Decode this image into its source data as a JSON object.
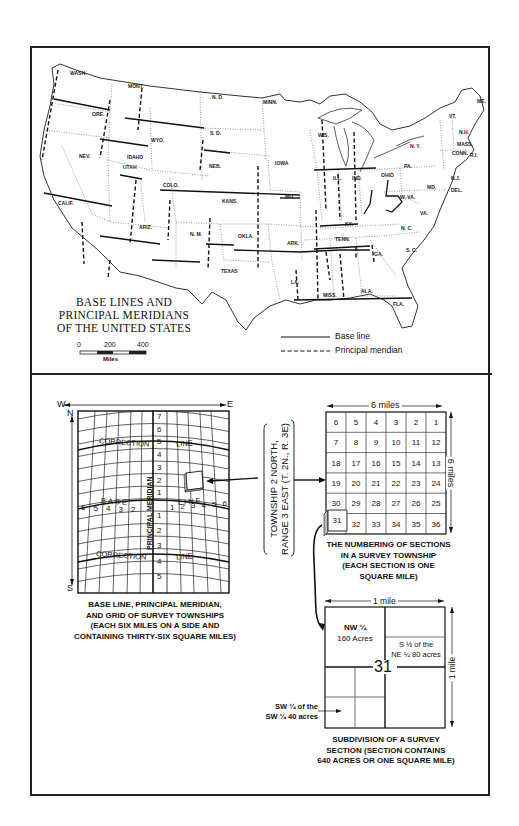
{
  "map": {
    "title_lines": [
      "BASE LINES AND",
      "PRINCIPAL MERIDIANS",
      "OF THE UNITED STATES"
    ],
    "scale": {
      "ticks": [
        "0",
        "200",
        "400"
      ],
      "unit": "Miles"
    },
    "legend": {
      "base_line": "Base line",
      "principal_meridian": "Principal meridian"
    },
    "states": [
      {
        "label": "WASH.",
        "x": 70,
        "y": 75
      },
      {
        "label": "MONT.",
        "x": 128,
        "y": 88
      },
      {
        "label": "N. D.",
        "x": 212,
        "y": 99
      },
      {
        "label": "MINN.",
        "x": 263,
        "y": 104
      },
      {
        "label": "ORE.",
        "x": 92,
        "y": 116
      },
      {
        "label": "WYO.",
        "x": 151,
        "y": 142
      },
      {
        "label": "S. D.",
        "x": 210,
        "y": 135
      },
      {
        "label": "IDAHO",
        "x": 127,
        "y": 159
      },
      {
        "label": "NEB.",
        "x": 209,
        "y": 168
      },
      {
        "label": "IOWA",
        "x": 275,
        "y": 165
      },
      {
        "label": "NEV.",
        "x": 79,
        "y": 158
      },
      {
        "label": "UTAH",
        "x": 123,
        "y": 169
      },
      {
        "label": "COLO.",
        "x": 163,
        "y": 187
      },
      {
        "label": "KANS.",
        "x": 222,
        "y": 203
      },
      {
        "label": "MO.",
        "x": 285,
        "y": 198
      },
      {
        "label": "CALIF.",
        "x": 58,
        "y": 205
      },
      {
        "label": "ARIZ.",
        "x": 139,
        "y": 229
      },
      {
        "label": "N. M.",
        "x": 190,
        "y": 236
      },
      {
        "label": "OKLA.",
        "x": 238,
        "y": 238
      },
      {
        "label": "TEXAS",
        "x": 221,
        "y": 273
      },
      {
        "label": "ARK.",
        "x": 287,
        "y": 245
      },
      {
        "label": "TENN.",
        "x": 335,
        "y": 241
      },
      {
        "label": "LA.",
        "x": 291,
        "y": 284
      },
      {
        "label": "MISS.",
        "x": 323,
        "y": 297
      },
      {
        "label": "ALA.",
        "x": 361,
        "y": 293
      },
      {
        "label": "GA.",
        "x": 374,
        "y": 256
      },
      {
        "label": "S. C.",
        "x": 406,
        "y": 252
      },
      {
        "label": "N. C.",
        "x": 401,
        "y": 230
      },
      {
        "label": "FLA.",
        "x": 393,
        "y": 306
      },
      {
        "label": "KY.",
        "x": 345,
        "y": 226
      },
      {
        "label": "WIS.",
        "x": 318,
        "y": 137
      },
      {
        "label": "ILL.",
        "x": 333,
        "y": 180
      },
      {
        "label": "IND.",
        "x": 352,
        "y": 180
      },
      {
        "label": "OHIO",
        "x": 381,
        "y": 177
      },
      {
        "label": "W. VA.",
        "x": 400,
        "y": 199
      },
      {
        "label": "VA.",
        "x": 420,
        "y": 215
      },
      {
        "label": "PA.",
        "x": 404,
        "y": 168
      },
      {
        "label": "N. Y.",
        "x": 410,
        "y": 148
      },
      {
        "label": "VT.",
        "x": 449,
        "y": 118
      },
      {
        "label": "ME.",
        "x": 477,
        "y": 103
      },
      {
        "label": "N.H.",
        "x": 459,
        "y": 134
      },
      {
        "label": "MASS.",
        "x": 457,
        "y": 146
      },
      {
        "label": "CONN.",
        "x": 452,
        "y": 155
      },
      {
        "label": "R.I.",
        "x": 470,
        "y": 157
      },
      {
        "label": "N.J.",
        "x": 451,
        "y": 180
      },
      {
        "label": "MD.",
        "x": 427,
        "y": 189
      },
      {
        "label": "DEL.",
        "x": 451,
        "y": 192
      }
    ]
  },
  "township_grid": {
    "compass": {
      "west": "W",
      "east": "E",
      "north": "N",
      "south": "S"
    },
    "correction_line_left": "CORRECTION",
    "correction_line_right": "LINE",
    "base_line_left": "BASE",
    "base_line_right": "LINE",
    "meridian_label": "PRINCIPAL MERIDIAN",
    "north_townships": [
      "7",
      "6",
      "5",
      "4",
      "3",
      "2",
      "1"
    ],
    "south_townships": [
      "1",
      "2",
      "3",
      "4",
      "5"
    ],
    "west_ranges": [
      "6",
      "5",
      "4",
      "3",
      "2"
    ],
    "east_ranges": [
      "1",
      "2",
      "3",
      "4",
      "5",
      "6"
    ],
    "caption_lines": [
      "BASE LINE, PRINCIPAL MERIDIAN,",
      "AND GRID OF SURVEY TOWNSHIPS",
      "(EACH SIX MILES ON A SIDE AND",
      "CONTAINING THIRTY-SIX SQUARE MILES)"
    ]
  },
  "township_label": {
    "line1": "TOWNSHIP 2 NORTH,",
    "line2": "RANGE 3 EAST (T. 2N., R. 3E)"
  },
  "sections": {
    "width_label": "6 miles",
    "height_label": "6 miles",
    "rows": [
      [
        "6",
        "5",
        "4",
        "3",
        "2",
        "1"
      ],
      [
        "7",
        "8",
        "9",
        "10",
        "11",
        "12"
      ],
      [
        "18",
        "17",
        "16",
        "15",
        "14",
        "13"
      ],
      [
        "19",
        "20",
        "21",
        "22",
        "23",
        "24"
      ],
      [
        "30",
        "29",
        "28",
        "27",
        "26",
        "25"
      ],
      [
        "31",
        "32",
        "33",
        "34",
        "35",
        "36"
      ]
    ],
    "highlight": "31",
    "caption_lines": [
      "THE NUMBERING OF SECTIONS",
      "IN A SURVEY TOWNSHIP",
      "(EACH SECTION IS ONE",
      "SQUARE MILE)"
    ]
  },
  "subdivision": {
    "width_label": "1 mile",
    "height_label": "1 mile",
    "section_number": "31",
    "nw_quarter": [
      "NW ¼",
      "160 Acres"
    ],
    "ne_half": [
      "S ½ of the",
      "NE ¼ 80 acres"
    ],
    "sw_callout": [
      "SW ¼ of the",
      "SW ¼ 40 acres"
    ],
    "caption_lines": [
      "SUBDIVISION OF A SURVEY",
      "SECTION (SECTION CONTAINS",
      "640 ACRES OR ONE SQUARE MILE)"
    ]
  }
}
